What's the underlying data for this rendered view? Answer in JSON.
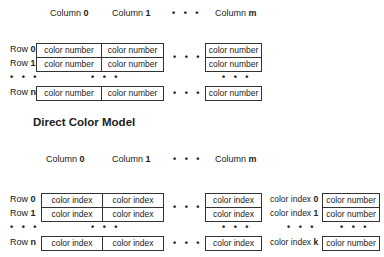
{
  "top": {
    "columns": [
      {
        "prefix": "Column ",
        "index": "0"
      },
      {
        "prefix": "Column ",
        "index": "1"
      },
      {
        "prefix": "Column ",
        "index": "m"
      }
    ],
    "rows": [
      {
        "prefix": "Row ",
        "index": "0"
      },
      {
        "prefix": "Row ",
        "index": "1"
      },
      {
        "prefix": "Row ",
        "index": "n"
      }
    ],
    "cell_text": "color number",
    "ellipsis": "• • •"
  },
  "title": "Direct Color Model",
  "bottom": {
    "columns": [
      {
        "prefix": "Column ",
        "index": "0"
      },
      {
        "prefix": "Column ",
        "index": "1"
      },
      {
        "prefix": "Column ",
        "index": "m"
      }
    ],
    "rows": [
      {
        "prefix": "Row ",
        "index": "0"
      },
      {
        "prefix": "Row ",
        "index": "1"
      },
      {
        "prefix": "Row ",
        "index": "n"
      }
    ],
    "cell_text": "color index",
    "lut_labels": [
      {
        "prefix": "color index ",
        "index": "0"
      },
      {
        "prefix": "color index ",
        "index": "1"
      },
      {
        "prefix": "color index ",
        "index": "k"
      }
    ],
    "lut_cell_text": "color number",
    "ellipsis": "• • •"
  }
}
